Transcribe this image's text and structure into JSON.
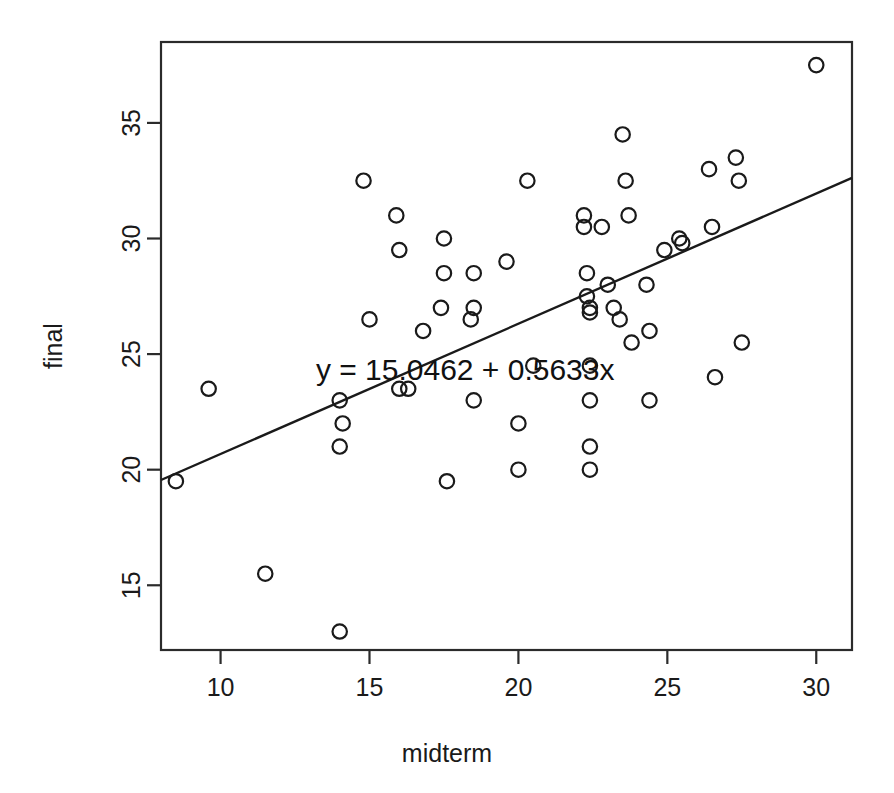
{
  "chart_data": {
    "type": "scatter",
    "title": "",
    "xlabel": "midterm",
    "ylabel": "final",
    "xlim": [
      8.0,
      31.2
    ],
    "ylim": [
      12.2,
      38.5
    ],
    "grid": false,
    "legend": false,
    "xticks": [
      10,
      15,
      20,
      25,
      30
    ],
    "xticklabels": [
      "10",
      "15",
      "20",
      "25",
      "30"
    ],
    "yticks": [
      15,
      20,
      25,
      30,
      35
    ],
    "yticklabels": [
      "15",
      "20",
      "25",
      "30",
      "35"
    ],
    "annotation": "y = 15.0462 + 0.5633x",
    "annotation_x": 13.2,
    "annotation_y": 23.9,
    "series": [
      {
        "name": "students",
        "marker": "open-circle",
        "color": "#1a1a1a",
        "points": [
          [
            8.5,
            19.5
          ],
          [
            9.6,
            23.5
          ],
          [
            11.5,
            15.5
          ],
          [
            14.0,
            13.0
          ],
          [
            14.0,
            21.0
          ],
          [
            14.0,
            23.0
          ],
          [
            14.1,
            22.0
          ],
          [
            14.8,
            32.5
          ],
          [
            15.0,
            26.5
          ],
          [
            15.9,
            31.0
          ],
          [
            16.0,
            29.5
          ],
          [
            16.0,
            23.5
          ],
          [
            16.3,
            23.5
          ],
          [
            16.8,
            26.0
          ],
          [
            17.4,
            27.0
          ],
          [
            17.5,
            28.5
          ],
          [
            17.5,
            30.0
          ],
          [
            17.6,
            19.5
          ],
          [
            18.4,
            26.5
          ],
          [
            18.5,
            27.0
          ],
          [
            18.5,
            28.5
          ],
          [
            18.5,
            23.0
          ],
          [
            19.6,
            29.0
          ],
          [
            20.0,
            20.0
          ],
          [
            20.0,
            22.0
          ],
          [
            20.3,
            32.5
          ],
          [
            20.5,
            24.5
          ],
          [
            22.2,
            31.0
          ],
          [
            22.2,
            30.5
          ],
          [
            22.3,
            28.5
          ],
          [
            22.3,
            27.5
          ],
          [
            22.4,
            27.0
          ],
          [
            22.4,
            26.8
          ],
          [
            22.4,
            24.5
          ],
          [
            22.4,
            23.0
          ],
          [
            22.4,
            21.0
          ],
          [
            22.4,
            20.0
          ],
          [
            22.8,
            30.5
          ],
          [
            23.0,
            28.0
          ],
          [
            23.2,
            27.0
          ],
          [
            23.4,
            26.5
          ],
          [
            23.5,
            34.5
          ],
          [
            23.6,
            32.5
          ],
          [
            23.7,
            31.0
          ],
          [
            23.8,
            25.5
          ],
          [
            24.3,
            28.0
          ],
          [
            24.4,
            26.0
          ],
          [
            24.4,
            23.0
          ],
          [
            24.9,
            29.5
          ],
          [
            25.4,
            30.0
          ],
          [
            25.5,
            29.8
          ],
          [
            26.4,
            33.0
          ],
          [
            26.5,
            30.5
          ],
          [
            26.6,
            24.0
          ],
          [
            27.3,
            33.5
          ],
          [
            27.4,
            32.5
          ],
          [
            27.5,
            25.5
          ],
          [
            30.0,
            37.5
          ]
        ]
      }
    ],
    "fit_line": {
      "equation": "y = 15.0462 + 0.5633x",
      "intercept": 15.0462,
      "slope": 0.5633,
      "x_start": 8.0,
      "x_end": 31.2,
      "color": "#1a1a1a"
    }
  },
  "figure": {
    "background": "#ffffff",
    "foreground": "#1a1a1a"
  }
}
